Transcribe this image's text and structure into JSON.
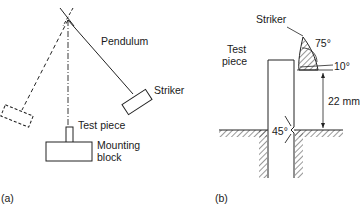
{
  "panel_a": {
    "label": "(a)",
    "pendulum": "Pendulum",
    "striker": "Striker",
    "test_piece": "Test piece",
    "mounting_block_line1": "Mounting",
    "mounting_block_line2": "block"
  },
  "panel_b": {
    "label": "(b)",
    "striker": "Striker",
    "test_piece_line1": "Test",
    "test_piece_line2": "piece",
    "angle_striker": "75°",
    "angle_tip": "10°",
    "height": "22 mm",
    "notch_angle": "45°"
  }
}
